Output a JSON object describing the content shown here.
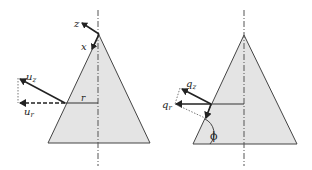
{
  "figure": {
    "left_panel": {
      "labels": {
        "z": "z",
        "x": "x",
        "u_z": "u",
        "u_z_sub": "z",
        "u_r": "u",
        "u_r_sub": "r",
        "r": "r"
      }
    },
    "right_panel": {
      "labels": {
        "q_z": "q",
        "q_z_sub": "z",
        "q_r": "q",
        "q_r_sub": "r",
        "phi": "ϕ"
      }
    },
    "colors": {
      "cone_fill": "#e4e4e4",
      "stroke": "#333333",
      "axis": "#555555"
    }
  }
}
